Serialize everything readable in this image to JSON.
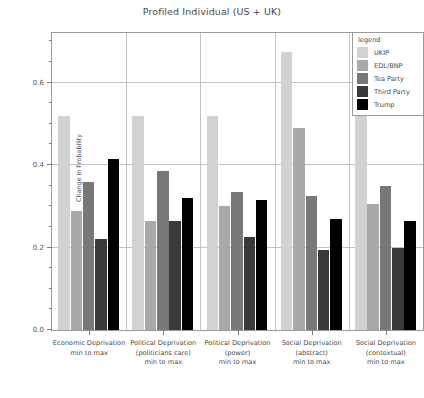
{
  "chart_data": {
    "type": "bar",
    "title": "Profiled Individual (US + UK)",
    "xlabel": "",
    "ylabel": "Change in Probability",
    "ylim": [
      0.0,
      0.72
    ],
    "grid": true,
    "legend_position": "top-right",
    "legend_title": "legend",
    "yticks": [
      0.0,
      0.2,
      0.4,
      0.6
    ],
    "ytick_labels": [
      "0.0",
      "0.2",
      "0.4",
      "0.6"
    ],
    "yticks_minor": [
      0.05,
      0.1,
      0.15,
      0.25,
      0.3,
      0.35,
      0.45,
      0.5,
      0.55,
      0.65,
      0.7
    ],
    "categories": [
      "Economic Deprivation\nmin to max",
      "Political Deprivation\n(politicians care)\nmin to max",
      "Political Deprivation\n(power)\nmin to max",
      "Social Deprivation\n(abstract)\nmin to max",
      "Social Deprivation\n(contextual)\nmin to max"
    ],
    "series": [
      {
        "name": "UKIP",
        "color": "#d2d2d2",
        "values": [
          0.52,
          0.52,
          0.52,
          0.675,
          0.52
        ]
      },
      {
        "name": "EDL/BNP",
        "color": "#a9a9a9",
        "values": [
          0.288,
          0.265,
          0.3,
          0.49,
          0.305
        ]
      },
      {
        "name": "Tea Party",
        "color": "#787878",
        "values": [
          0.358,
          0.385,
          0.335,
          0.325,
          0.35
        ]
      },
      {
        "name": "Third Party",
        "color": "#3a3a3a",
        "values": [
          0.22,
          0.265,
          0.225,
          0.195,
          0.2
        ]
      },
      {
        "name": "Trump",
        "color": "#000000",
        "values": [
          0.415,
          0.32,
          0.315,
          0.27,
          0.265
        ]
      }
    ]
  }
}
